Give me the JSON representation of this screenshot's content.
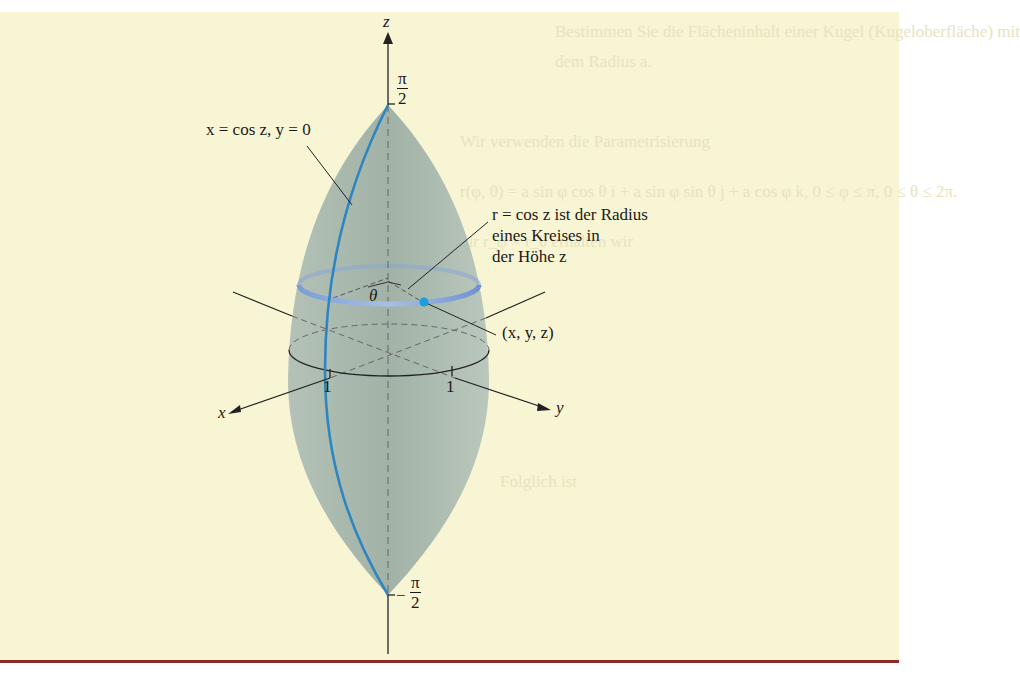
{
  "figure": {
    "background_color": "#f7f5d3",
    "surface_color": "#9fb0a8",
    "curve_color": "#2e86c1",
    "circle_color": "#7c9fd6",
    "axes": {
      "z_label": "z",
      "x_label": "x",
      "y_label": "y",
      "z_top_tick": {
        "num": "π",
        "den": "2",
        "sign": ""
      },
      "z_bottom_tick": {
        "num": "π",
        "den": "2",
        "sign": "−"
      },
      "x_tick": "1",
      "y_tick": "1"
    },
    "annotations": {
      "curve": "x = cos z, y = 0",
      "radius_line1": "r = cos z ist der Radius",
      "radius_line2": "eines Kreises in",
      "radius_line3": "der Höhe z",
      "point": "(x, y, z)",
      "angle": "θ"
    }
  },
  "background_text": {
    "line1": "Bestimmen Sie die Flächeninhalt einer Kugel (Kugeloberfläche) mit",
    "line2": "dem Radius a.",
    "line3": "Wir verwenden die Parametrisierung",
    "line4": "r(φ, θ) = a sin φ cos θ i + a sin φ sin θ j + a cos φ k, 0 ≤ φ ≤ π, 0 ≤ θ ≤ 2π.",
    "line5": "Für r_φ × r_θ erhalten wir",
    "line6": "Folglich ist"
  }
}
